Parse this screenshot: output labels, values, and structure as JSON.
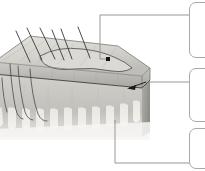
{
  "figure": {
    "background_color": "#ffffff",
    "width": 205,
    "height": 171,
    "illustration": {
      "name": "skin-block-diagram",
      "style": "grayscale-3d-block",
      "colors": {
        "epidermis_top": "#d6d4cf",
        "epidermis_top_shadow": "#b9b7b2",
        "epidermis_front": "#b3b1ac",
        "dermis_front": "#c9c7c2",
        "dermis_side": "#a5a39e",
        "papillae": "#e2e0db",
        "outline": "#5a5a5a",
        "hair": "#3c3c3c"
      },
      "structures": [
        {
          "name": "hair-shaft",
          "count": 6
        },
        {
          "name": "epidermis-layer"
        },
        {
          "name": "dermis-layer"
        },
        {
          "name": "dermal-papillae"
        },
        {
          "name": "hair-follicle",
          "count": 4
        }
      ]
    },
    "leaders": [
      {
        "name": "leader-top",
        "marker": "dot",
        "marker_color": "#1a1a1a",
        "points": "108,59 100,59 100,15 196,15",
        "color": "#8c8c8c"
      },
      {
        "name": "leader-middle",
        "marker": "arrow",
        "marker_color": "#1a1a1a",
        "points": "128,88 146,82 196,82",
        "color": "#8c8c8c"
      },
      {
        "name": "leader-bottom",
        "marker": "none",
        "marker_color": "#1a1a1a",
        "points": "115,120 115,163 196,163",
        "color": "#8c8c8c"
      }
    ],
    "callouts": [
      {
        "name": "callout-box-1",
        "text": "",
        "x": 189,
        "y": 2,
        "width": 30,
        "height": 56
      },
      {
        "name": "callout-box-2",
        "text": "",
        "x": 189,
        "y": 68,
        "width": 30,
        "height": 54
      },
      {
        "name": "callout-box-3",
        "text": "",
        "x": 189,
        "y": 128,
        "width": 30,
        "height": 41
      }
    ]
  }
}
